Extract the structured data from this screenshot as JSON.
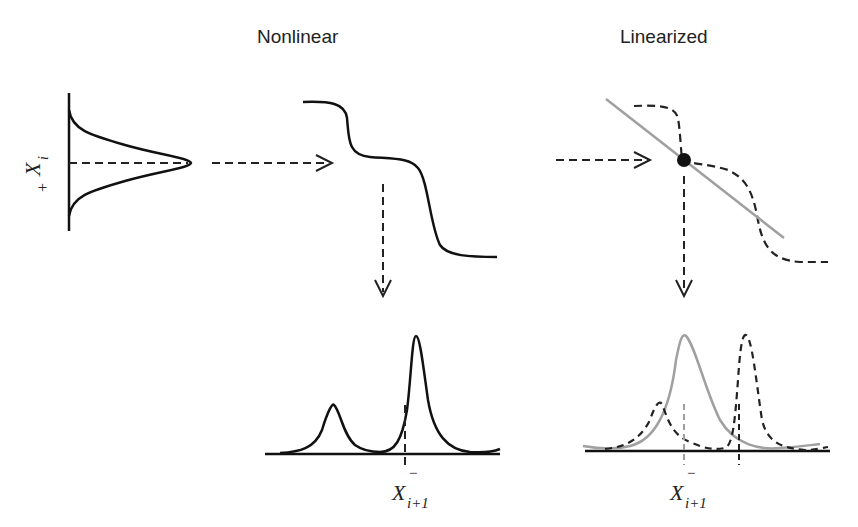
{
  "titles": {
    "nonlinear": "Nonlinear",
    "linearized": "Linearized"
  },
  "labels": {
    "input_state": "X",
    "input_sub": "i",
    "input_sup": "+",
    "output_state": "X",
    "output_sub": "i+1",
    "output_sup": "−"
  },
  "colors": {
    "curve": "#111111",
    "linear_approx": "#a0a0a0",
    "dashed": "#222222"
  },
  "panels": [
    {
      "id": "input-gaussian",
      "description": "Gaussian prior distribution over X_i^+ (rotated, vertical axis)"
    },
    {
      "id": "nonlinear-function",
      "description": "Nonlinear step-like transfer function"
    },
    {
      "id": "nonlinear-output",
      "description": "Bimodal output distribution with X_{i+1}^- marker"
    },
    {
      "id": "linearized-function",
      "description": "Linear approximation (gray line) at operating point over dashed nonlinear function"
    },
    {
      "id": "linearized-output",
      "description": "Gaussian output (gray) vs true bimodal output (dashed) with X_{i+1}^- marker"
    }
  ]
}
